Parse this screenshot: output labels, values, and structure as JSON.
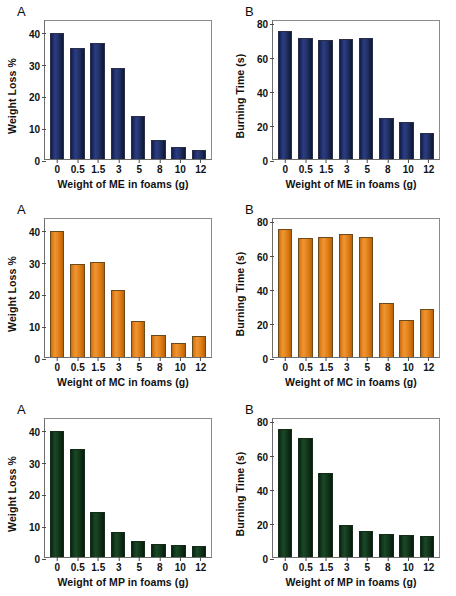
{
  "figure": {
    "width": 456,
    "height": 596,
    "background": "#ffffff",
    "rows": 3,
    "columns": 2
  },
  "colors": {
    "blue": "#1b2b68",
    "orange": "#e0811d",
    "green": "#11371c",
    "axis": "#6d6d6d",
    "text": "#111111"
  },
  "axes": {
    "weight_loss": {
      "label": "Weight Loss %",
      "ticks": [
        "0",
        "10",
        "20",
        "30",
        "40"
      ],
      "tick_values": [
        0,
        10,
        20,
        30,
        40
      ],
      "min": 0,
      "max": 44
    },
    "burning_time": {
      "label": "Burning Time (s)",
      "ticks": [
        "0",
        "20",
        "40",
        "60",
        "80"
      ],
      "tick_values": [
        0,
        20,
        40,
        60,
        80
      ],
      "min": 0,
      "max": 82
    },
    "categories": [
      "0",
      "0.5",
      "1.5",
      "3",
      "5",
      "8",
      "10",
      "12"
    ]
  },
  "panels": [
    {
      "id": "me-weight-loss",
      "letter": "A",
      "color_key": "blue",
      "ytitle": "Weight Loss %",
      "xtitle": "Weight of ME in foams (g)",
      "yaxis": "weight_loss"
    },
    {
      "id": "me-burning-time",
      "letter": "B",
      "color_key": "blue",
      "ytitle": "Burning Time (s)",
      "xtitle": "Weight of ME in foams (g)",
      "yaxis": "burning_time"
    },
    {
      "id": "mc-weight-loss",
      "letter": "A",
      "color_key": "orange",
      "ytitle": "Weight Loss %",
      "xtitle": "Weight of MC in foams (g)",
      "yaxis": "weight_loss"
    },
    {
      "id": "mc-burning-time",
      "letter": "B",
      "color_key": "orange",
      "ytitle": "Burning Time (s)",
      "xtitle": "Weight of MC in foams (g)",
      "yaxis": "burning_time"
    },
    {
      "id": "mp-weight-loss",
      "letter": "A",
      "color_key": "green",
      "ytitle": "Weight Loss %",
      "xtitle": "Weight of MP in foams (g)",
      "yaxis": "weight_loss"
    },
    {
      "id": "mp-burning-time",
      "letter": "B",
      "color_key": "green",
      "ytitle": "Burning Time (s)",
      "xtitle": "Weight of MP in foams (g)",
      "yaxis": "burning_time"
    }
  ],
  "chart_data": [
    {
      "panel_id": "me-weight-loss",
      "type": "bar",
      "title": "A",
      "xlabel": "Weight of ME in foams (g)",
      "ylabel": "Weight Loss %",
      "categories": [
        "0",
        "0.5",
        "1.5",
        "3",
        "5",
        "8",
        "10",
        "12"
      ],
      "values": [
        39.5,
        35.0,
        36.4,
        28.6,
        13.5,
        5.9,
        3.8,
        2.8
      ],
      "ylim": [
        0,
        44
      ],
      "yticks": [
        0,
        10,
        20,
        30,
        40
      ],
      "color": "#1b2b68",
      "grid": false,
      "legend": "none"
    },
    {
      "panel_id": "me-burning-time",
      "type": "bar",
      "title": "B",
      "xlabel": "Weight of ME in foams (g)",
      "ylabel": "Burning Time (s)",
      "categories": [
        "0",
        "0.5",
        "1.5",
        "3",
        "5",
        "8",
        "10",
        "12"
      ],
      "values": [
        75,
        71,
        70,
        70.5,
        70.8,
        24.3,
        21.5,
        15.2
      ],
      "ylim": [
        0,
        82
      ],
      "yticks": [
        0,
        20,
        40,
        60,
        80
      ],
      "color": "#1b2b68",
      "grid": false,
      "legend": "none"
    },
    {
      "panel_id": "mc-weight-loss",
      "type": "bar",
      "title": "A",
      "xlabel": "Weight of MC in foams (g)",
      "ylabel": "Weight Loss %",
      "categories": [
        "0",
        "0.5",
        "1.5",
        "3",
        "5",
        "8",
        "10",
        "12"
      ],
      "values": [
        39.6,
        29.2,
        29.9,
        21.0,
        11.4,
        6.8,
        4.3,
        6.6
      ],
      "ylim": [
        0,
        44
      ],
      "yticks": [
        0,
        10,
        20,
        30,
        40
      ],
      "color": "#e0811d",
      "grid": false,
      "legend": "none"
    },
    {
      "panel_id": "mc-burning-time",
      "type": "bar",
      "title": "B",
      "xlabel": "Weight of MC in foams (g)",
      "ylabel": "Burning Time (s)",
      "categories": [
        "0",
        "0.5",
        "1.5",
        "3",
        "5",
        "8",
        "10",
        "12"
      ],
      "values": [
        75,
        70,
        70.5,
        72,
        70.5,
        31.5,
        21.5,
        28.0
      ],
      "ylim": [
        0,
        82
      ],
      "yticks": [
        0,
        20,
        40,
        60,
        80
      ],
      "color": "#e0811d",
      "grid": false,
      "legend": "none"
    },
    {
      "panel_id": "mp-weight-loss",
      "type": "bar",
      "title": "A",
      "xlabel": "Weight of MP in foams (g)",
      "ylabel": "Weight Loss %",
      "categories": [
        "0",
        "0.5",
        "1.5",
        "3",
        "5",
        "8",
        "10",
        "12"
      ],
      "values": [
        39.6,
        33.9,
        14.2,
        7.8,
        5.0,
        4.2,
        3.7,
        3.6
      ],
      "ylim": [
        0,
        44
      ],
      "yticks": [
        0,
        10,
        20,
        30,
        40
      ],
      "color": "#11371c",
      "grid": false,
      "legend": "none"
    },
    {
      "panel_id": "mp-burning-time",
      "type": "bar",
      "title": "B",
      "xlabel": "Weight of MP in foams (g)",
      "ylabel": "Burning Time (s)",
      "categories": [
        "0",
        "0.5",
        "1.5",
        "3",
        "5",
        "8",
        "10",
        "12"
      ],
      "values": [
        75,
        70,
        49,
        19,
        15.5,
        13.5,
        12.8,
        12.2
      ],
      "ylim": [
        0,
        82
      ],
      "yticks": [
        0,
        20,
        40,
        60,
        80
      ],
      "color": "#11371c",
      "grid": false,
      "legend": "none"
    }
  ]
}
